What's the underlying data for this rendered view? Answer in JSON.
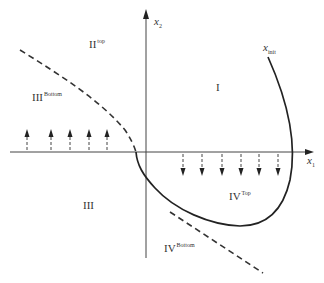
{
  "diagram": {
    "type": "phase-plane",
    "axes": {
      "x_axis": {
        "label": "x",
        "subscript": "1"
      },
      "y_axis": {
        "label": "x",
        "subscript": "2"
      }
    },
    "trajectory_label": {
      "label": "x",
      "subscript": "init"
    },
    "regions": [
      {
        "id": "I",
        "label": "I",
        "superscript": ""
      },
      {
        "id": "II-top",
        "label": "II",
        "superscript": "top"
      },
      {
        "id": "III-bottom",
        "label": "III",
        "superscript": "Bottom"
      },
      {
        "id": "III",
        "label": "III",
        "superscript": ""
      },
      {
        "id": "IV-top",
        "label": "IV",
        "superscript": "Top"
      },
      {
        "id": "IV-bottom",
        "label": "IV",
        "superscript": "Bottom"
      }
    ],
    "arrows": {
      "up_count": 5,
      "down_count": 6
    },
    "colors": {
      "stroke": "#222222",
      "dashed": "#333333",
      "axis": "#555555"
    }
  }
}
